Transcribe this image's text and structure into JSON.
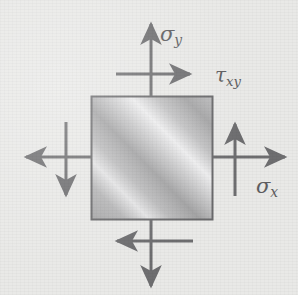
{
  "figure": {
    "kind": "plane-stress-element-diagram",
    "background_color": "#e9e9e7",
    "stroke_color": "#6e6e70",
    "label_color": "#5d5d60",
    "element": {
      "shape": "square",
      "x": 91,
      "y": 96,
      "width": 122,
      "height": 124,
      "border_color": "#6b6b6d",
      "fill_style": "diagonal-metallic-gradient",
      "fill_light": "#ececed",
      "fill_mid": "#b9b9ba",
      "fill_dark": "#9b9b9c",
      "gradient_angle_deg": 45
    },
    "labels": {
      "sigma_y": {
        "base": "σ",
        "sub": "y",
        "text": "σy"
      },
      "tau_xy": {
        "base": "τ",
        "sub": "xy",
        "text": "τxy"
      },
      "sigma_x": {
        "base": "σ",
        "sub": "x",
        "text": "σx"
      }
    },
    "arrows": [
      {
        "name": "sigma-y-top",
        "label": "σy",
        "type": "normal-stress",
        "direction": "up",
        "x1": 151,
        "y1": 96,
        "x2": 151,
        "y2": 22
      },
      {
        "name": "sigma-y-bottom",
        "label": "σy",
        "type": "normal-stress",
        "direction": "down",
        "x1": 151,
        "y1": 220,
        "x2": 151,
        "y2": 288
      },
      {
        "name": "sigma-x-right",
        "label": "σx",
        "type": "normal-stress",
        "direction": "right",
        "x1": 213,
        "y1": 157,
        "x2": 287,
        "y2": 157
      },
      {
        "name": "sigma-x-left",
        "label": "σx",
        "type": "normal-stress",
        "direction": "left",
        "x1": 91,
        "y1": 157,
        "x2": 24,
        "y2": 157
      },
      {
        "name": "tau-xy-top",
        "label": "τxy",
        "type": "shear-stress",
        "direction": "right",
        "x1": 116,
        "y1": 74,
        "x2": 192,
        "y2": 74
      },
      {
        "name": "tau-xy-bottom",
        "label": "τxy",
        "type": "shear-stress",
        "direction": "left",
        "x1": 193,
        "y1": 241,
        "x2": 114,
        "y2": 241
      },
      {
        "name": "tau-xy-left",
        "label": "τxy",
        "type": "shear-stress",
        "direction": "down",
        "x1": 66,
        "y1": 122,
        "x2": 66,
        "y2": 197
      },
      {
        "name": "tau-xy-right",
        "label": "τxy",
        "type": "shear-stress",
        "direction": "up",
        "x1": 235,
        "y1": 196,
        "x2": 235,
        "y2": 122
      }
    ]
  }
}
